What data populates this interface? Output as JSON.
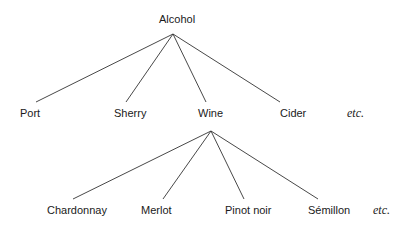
{
  "root": {
    "label": "Alcohol"
  },
  "level1": [
    {
      "label": "Port"
    },
    {
      "label": "Sherry"
    },
    {
      "label": "Wine"
    },
    {
      "label": "Cider"
    }
  ],
  "level1_more": "etc.",
  "level2_parent": "Wine",
  "level2": [
    {
      "label": "Chardonnay"
    },
    {
      "label": "Merlot"
    },
    {
      "label": "Pinot noir"
    },
    {
      "label": "Sémillon"
    }
  ],
  "level2_more": "etc.",
  "colors": {
    "line": "#333333",
    "text": "#1a1a1a"
  }
}
